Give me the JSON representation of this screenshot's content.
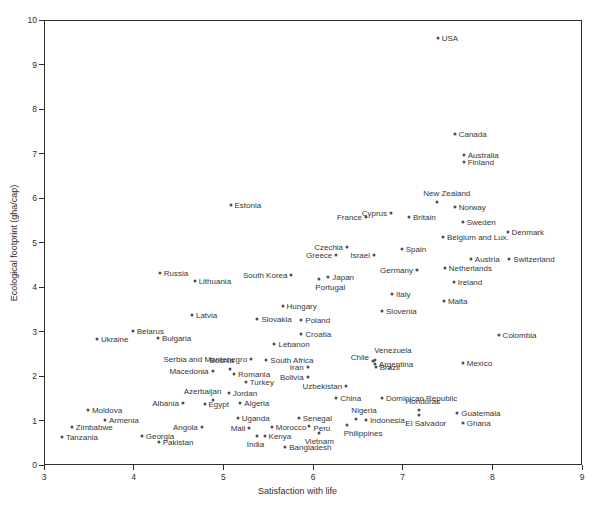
{
  "chart_data": {
    "type": "scatter",
    "title": "",
    "xlabel": "Satisfaction with life",
    "ylabel": "Ecological footprint (gha/cap)",
    "xlim": [
      3,
      9
    ],
    "ylim": [
      0,
      10
    ],
    "x_ticks": [
      3,
      4,
      5,
      6,
      7,
      8,
      9
    ],
    "y_ticks": [
      0,
      1,
      2,
      3,
      4,
      5,
      6,
      7,
      8,
      9,
      10
    ],
    "grid": false,
    "legend": "none",
    "marker_color": "#4f4f4f",
    "label_color": "#363636",
    "axis_color": "#2e2e2e",
    "points": [
      {
        "n": "USA",
        "x": 7.39,
        "y": 9.6,
        "lp": "r"
      },
      {
        "n": "Canada",
        "x": 7.58,
        "y": 7.43,
        "lp": "r"
      },
      {
        "n": "Australia",
        "x": 7.68,
        "y": 6.97,
        "lp": "r"
      },
      {
        "n": "Finland",
        "x": 7.68,
        "y": 6.8,
        "lp": "r"
      },
      {
        "n": "New Zealand",
        "x": 7.38,
        "y": 5.9,
        "lp": "a",
        "ox": 10
      },
      {
        "n": "Norway",
        "x": 7.58,
        "y": 5.79,
        "lp": "r"
      },
      {
        "n": "Estonia",
        "x": 5.08,
        "y": 5.84,
        "lp": "r"
      },
      {
        "n": "Cyprus",
        "x": 6.87,
        "y": 5.66,
        "lp": "l"
      },
      {
        "n": "France",
        "x": 6.59,
        "y": 5.57,
        "lp": "l"
      },
      {
        "n": "Britain",
        "x": 7.07,
        "y": 5.57,
        "lp": "r"
      },
      {
        "n": "Sweden",
        "x": 7.67,
        "y": 5.47,
        "lp": "r"
      },
      {
        "n": "Denmark",
        "x": 8.17,
        "y": 5.24,
        "lp": "r"
      },
      {
        "n": "Belgium and Lux.",
        "x": 7.45,
        "y": 5.13,
        "lp": "r"
      },
      {
        "n": "Czechia",
        "x": 6.38,
        "y": 4.89,
        "lp": "l"
      },
      {
        "n": "Greece",
        "x": 6.26,
        "y": 4.72,
        "lp": "l"
      },
      {
        "n": "Israel",
        "x": 6.68,
        "y": 4.73,
        "lp": "l"
      },
      {
        "n": "Spain",
        "x": 6.99,
        "y": 4.85,
        "lp": "r"
      },
      {
        "n": "Austria",
        "x": 7.76,
        "y": 4.62,
        "lp": "r"
      },
      {
        "n": "Switzerland",
        "x": 8.19,
        "y": 4.62,
        "lp": "r"
      },
      {
        "n": "Germany",
        "x": 7.16,
        "y": 4.38,
        "lp": "l"
      },
      {
        "n": "Netherlands",
        "x": 7.47,
        "y": 4.42,
        "lp": "r"
      },
      {
        "n": "Russia",
        "x": 4.29,
        "y": 4.31,
        "lp": "r"
      },
      {
        "n": "Lithuania",
        "x": 4.68,
        "y": 4.13,
        "lp": "r"
      },
      {
        "n": "South Korea",
        "x": 5.76,
        "y": 4.27,
        "lp": "l"
      },
      {
        "n": "Japan",
        "x": 6.17,
        "y": 4.23,
        "lp": "r"
      },
      {
        "n": "Portugal",
        "x": 6.07,
        "y": 4.18,
        "lp": "b",
        "ox": 11
      },
      {
        "n": "Ireland",
        "x": 7.57,
        "y": 4.12,
        "lp": "r"
      },
      {
        "n": "Italy",
        "x": 6.88,
        "y": 3.84,
        "lp": "r"
      },
      {
        "n": "Malta",
        "x": 7.46,
        "y": 3.69,
        "lp": "r"
      },
      {
        "n": "Hungary",
        "x": 5.66,
        "y": 3.58,
        "lp": "r"
      },
      {
        "n": "Latvia",
        "x": 4.65,
        "y": 3.36,
        "lp": "r"
      },
      {
        "n": "Slovakia",
        "x": 5.38,
        "y": 3.28,
        "lp": "r"
      },
      {
        "n": "Poland",
        "x": 5.87,
        "y": 3.26,
        "lp": "r"
      },
      {
        "n": "Slovenia",
        "x": 6.77,
        "y": 3.45,
        "lp": "r"
      },
      {
        "n": "Belarus",
        "x": 3.99,
        "y": 3.01,
        "lp": "r"
      },
      {
        "n": "Bulgaria",
        "x": 4.27,
        "y": 2.85,
        "lp": "r"
      },
      {
        "n": "Ukraine",
        "x": 3.59,
        "y": 2.83,
        "lp": "r"
      },
      {
        "n": "Croatia",
        "x": 5.87,
        "y": 2.94,
        "lp": "r"
      },
      {
        "n": "Colombia",
        "x": 8.07,
        "y": 2.92,
        "lp": "r"
      },
      {
        "n": "Lebanon",
        "x": 5.57,
        "y": 2.72,
        "lp": "r"
      },
      {
        "n": "Serbia and Montenegro",
        "x": 5.31,
        "y": 2.39,
        "lp": "l"
      },
      {
        "n": "South Africa",
        "x": 5.48,
        "y": 2.37,
        "lp": "r"
      },
      {
        "n": "Bosnia",
        "x": 5.07,
        "y": 2.15,
        "lp": "a",
        "ox": -8
      },
      {
        "n": "Macedonia",
        "x": 4.88,
        "y": 2.11,
        "lp": "l"
      },
      {
        "n": "Romania",
        "x": 5.12,
        "y": 2.04,
        "lp": "r"
      },
      {
        "n": "Turkey",
        "x": 5.25,
        "y": 1.87,
        "lp": "r"
      },
      {
        "n": "Iran",
        "x": 5.94,
        "y": 2.2,
        "lp": "l"
      },
      {
        "n": "Bolivia",
        "x": 5.94,
        "y": 1.98,
        "lp": "l"
      },
      {
        "n": "Chile",
        "x": 6.67,
        "y": 2.34,
        "lp": "l",
        "oy": -4
      },
      {
        "n": "Venezuela",
        "x": 6.69,
        "y": 2.37,
        "lp": "a",
        "ox": 18,
        "oy": -1
      },
      {
        "n": "Argentina",
        "x": 6.69,
        "y": 2.28,
        "lp": "r"
      },
      {
        "n": "Brazil",
        "x": 6.7,
        "y": 2.2,
        "lp": "r"
      },
      {
        "n": "Mexico",
        "x": 7.67,
        "y": 2.3,
        "lp": "r"
      },
      {
        "n": "Uzbekistan",
        "x": 6.37,
        "y": 1.78,
        "lp": "l"
      },
      {
        "n": "Moldova",
        "x": 3.49,
        "y": 1.24,
        "lp": "r"
      },
      {
        "n": "Azerbaijan",
        "x": 4.88,
        "y": 1.47,
        "lp": "a",
        "ox": -10
      },
      {
        "n": "Jordan",
        "x": 5.06,
        "y": 1.62,
        "lp": "r"
      },
      {
        "n": "Algeria",
        "x": 5.19,
        "y": 1.4,
        "lp": "r"
      },
      {
        "n": "Egypt",
        "x": 4.79,
        "y": 1.37,
        "lp": "r"
      },
      {
        "n": "Albania",
        "x": 4.55,
        "y": 1.39,
        "lp": "l"
      },
      {
        "n": "China",
        "x": 6.26,
        "y": 1.51,
        "lp": "r"
      },
      {
        "n": "Dominican Republic",
        "x": 6.77,
        "y": 1.51,
        "lp": "r"
      },
      {
        "n": "Honduras",
        "x": 7.18,
        "y": 1.24,
        "lp": "a",
        "ox": 4
      },
      {
        "n": "El Salvador",
        "x": 7.18,
        "y": 1.13,
        "lp": "b",
        "ox": 7
      },
      {
        "n": "Guatemala",
        "x": 7.61,
        "y": 1.16,
        "lp": "r"
      },
      {
        "n": "Ghana",
        "x": 7.67,
        "y": 0.95,
        "lp": "r"
      },
      {
        "n": "Armenia",
        "x": 3.68,
        "y": 1.01,
        "lp": "r"
      },
      {
        "n": "Uganda",
        "x": 5.16,
        "y": 1.05,
        "lp": "r"
      },
      {
        "n": "Zimbabwe",
        "x": 3.31,
        "y": 0.85,
        "lp": "r"
      },
      {
        "n": "Angola",
        "x": 4.76,
        "y": 0.85,
        "lp": "l"
      },
      {
        "n": "Mali",
        "x": 5.29,
        "y": 0.83,
        "lp": "l"
      },
      {
        "n": "Senegal",
        "x": 5.84,
        "y": 1.06,
        "lp": "r"
      },
      {
        "n": "Nigeria",
        "x": 6.48,
        "y": 1.03,
        "lp": "a",
        "ox": 8
      },
      {
        "n": "Indonesia",
        "x": 6.59,
        "y": 1.01,
        "lp": "r"
      },
      {
        "n": "Philippines",
        "x": 6.38,
        "y": 0.91,
        "lp": "b",
        "ox": 16
      },
      {
        "n": "Morocco",
        "x": 5.54,
        "y": 0.85,
        "lp": "r"
      },
      {
        "n": "Peru",
        "x": 5.96,
        "y": 0.88,
        "lp": "r",
        "oy": 2
      },
      {
        "n": "Tanzania",
        "x": 3.2,
        "y": 0.64,
        "lp": "r"
      },
      {
        "n": "Georgia",
        "x": 4.09,
        "y": 0.65,
        "lp": "r"
      },
      {
        "n": "Pakistan",
        "x": 4.28,
        "y": 0.52,
        "lp": "r"
      },
      {
        "n": "India",
        "x": 5.38,
        "y": 0.65,
        "lp": "b",
        "ox": -2
      },
      {
        "n": "Kenya",
        "x": 5.46,
        "y": 0.65,
        "lp": "r"
      },
      {
        "n": "Vietnam",
        "x": 6.07,
        "y": 0.71,
        "lp": "b"
      },
      {
        "n": "Bangladesh",
        "x": 5.69,
        "y": 0.41,
        "lp": "r"
      }
    ]
  },
  "layout": {
    "plot_left": 44,
    "plot_top": 20,
    "plot_width": 538,
    "plot_height": 445
  }
}
